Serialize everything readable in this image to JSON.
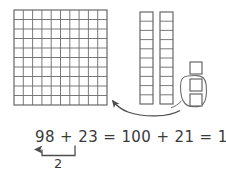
{
  "figure": {
    "title_visible": false,
    "background_color": "#ffffff",
    "line_color": "#4d4d4d",
    "text_color": "#3a3a3a"
  },
  "base_ten_blocks": {
    "hundred_flat": {
      "name": "hundred-square-grid",
      "rows": 10,
      "columns": 10,
      "total_units": 100,
      "x": 14,
      "y": 10,
      "width": 93,
      "height": 95
    },
    "ten_rods": [
      {
        "name": "ten-rod-1",
        "cells": 10,
        "total_units": 10,
        "x": 140,
        "y": 12,
        "width": 13,
        "height": 92
      },
      {
        "name": "ten-rod-2",
        "cells": 10,
        "total_units": 10,
        "x": 160,
        "y": 12,
        "width": 13,
        "height": 92
      }
    ],
    "unit_cubes": [
      {
        "name": "unit-cube-1",
        "x": 190,
        "y": 62,
        "size": 12,
        "circled": false
      },
      {
        "name": "unit-cube-2",
        "x": 190,
        "y": 78,
        "size": 12,
        "circled": true
      },
      {
        "name": "unit-cube-3",
        "x": 190,
        "y": 94,
        "size": 12,
        "circled": true
      }
    ],
    "lasso": {
      "name": "circled-units-lasso",
      "encircled_count": 2,
      "label": "2 ones moved"
    },
    "move_arrow": {
      "name": "regroup-arrow",
      "from": "circled units",
      "to": "hundred square grid",
      "direction": "right-to-left"
    }
  },
  "equation": {
    "full": "98 + 23 = 100 + 21 = 121",
    "tokens": [
      {
        "text": "98",
        "name": "addend-98"
      },
      {
        "text": "+",
        "name": "plus-sign-1"
      },
      {
        "text": "23",
        "name": "addend-23"
      },
      {
        "text": "=",
        "name": "equals-sign-1"
      },
      {
        "text": "100",
        "name": "term-100"
      },
      {
        "text": "+",
        "name": "plus-sign-2"
      },
      {
        "text": "21",
        "name": "term-21"
      },
      {
        "text": "=",
        "name": "equals-sign-2"
      },
      {
        "text": "121",
        "name": "sum-121"
      }
    ]
  },
  "regroup_annotation": {
    "amount_label": "2",
    "name": "regroup-bracket",
    "description": "2 moved from 23 to 98"
  }
}
